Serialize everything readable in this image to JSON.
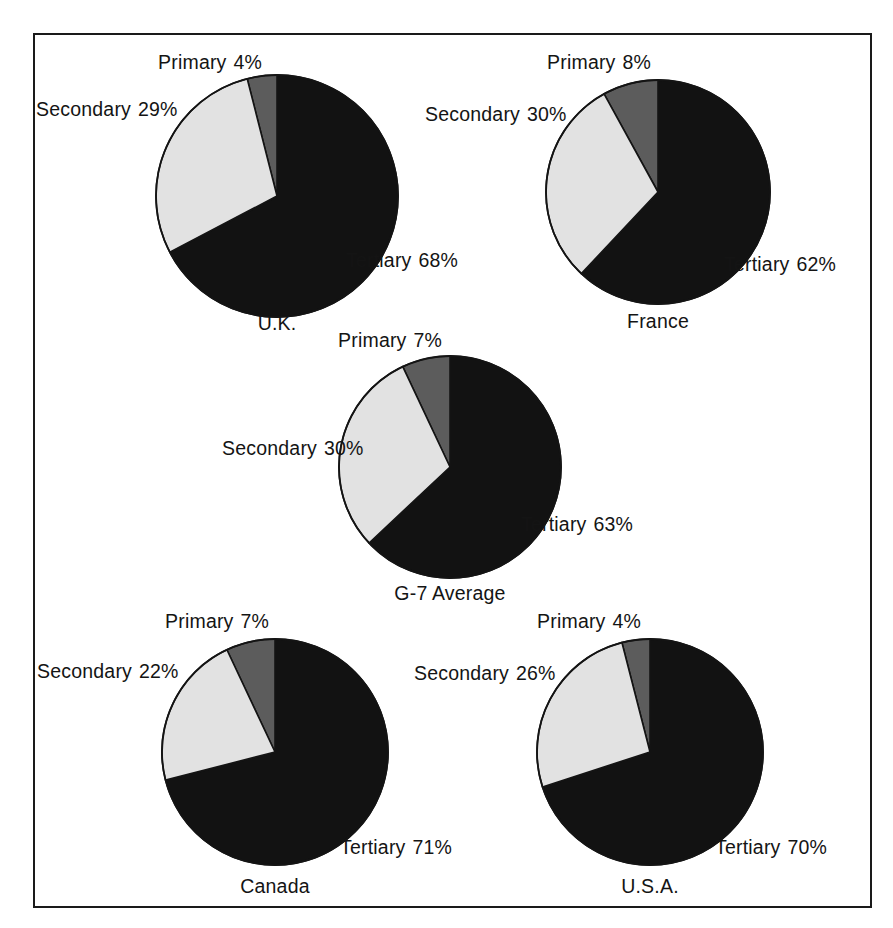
{
  "figure": {
    "border_color": "#1a1a1a",
    "background": "#ffffff"
  },
  "series_colors": {
    "primary": "#5c5c5c",
    "secondary": "#e2e2e2",
    "tertiary": "#121212",
    "outline": "#141414"
  },
  "labels": {
    "primary": "Primary",
    "secondary": "Secondary",
    "tertiary": "Tertiary"
  },
  "charts": [
    {
      "caption": "U.K.",
      "primary_label": "Primary",
      "primary_pct": "4%",
      "secondary_label": "Secondary",
      "secondary_pct": "29%",
      "tertiary_label": "Tertiary",
      "tertiary_pct": "68%"
    },
    {
      "caption": "France",
      "primary_label": "Primary",
      "primary_pct": "8%",
      "secondary_label": "Secondary",
      "secondary_pct": "30%",
      "tertiary_label": "Tertiary",
      "tertiary_pct": "62%"
    },
    {
      "caption": "G-7 Average",
      "primary_label": "Primary",
      "primary_pct": "7%",
      "secondary_label": "Secondary",
      "secondary_pct": "30%",
      "tertiary_label": "Tertiary",
      "tertiary_pct": "63%"
    },
    {
      "caption": "Canada",
      "primary_label": "Primary",
      "primary_pct": "7%",
      "secondary_label": "Secondary",
      "secondary_pct": "22%",
      "tertiary_label": "Tertiary",
      "tertiary_pct": "71%"
    },
    {
      "caption": "U.S.A.",
      "primary_label": "Primary",
      "primary_pct": "4%",
      "secondary_label": "Secondary",
      "secondary_pct": "26%",
      "tertiary_label": "Tertiary",
      "tertiary_pct": "70%"
    }
  ],
  "chart_data": [
    {
      "type": "pie",
      "title": "U.K.",
      "categories": [
        "Primary",
        "Secondary",
        "Tertiary"
      ],
      "values": [
        4,
        29,
        68
      ],
      "unit": "percent",
      "colors": [
        "#5c5c5c",
        "#e2e2e2",
        "#121212"
      ],
      "start_angle_deg": 0,
      "direction": "tertiary-clockwise-from-top",
      "legend": "inline-labels"
    },
    {
      "type": "pie",
      "title": "France",
      "categories": [
        "Primary",
        "Secondary",
        "Tertiary"
      ],
      "values": [
        8,
        30,
        62
      ],
      "unit": "percent",
      "colors": [
        "#5c5c5c",
        "#e2e2e2",
        "#121212"
      ],
      "start_angle_deg": 0,
      "direction": "tertiary-clockwise-from-top",
      "legend": "inline-labels"
    },
    {
      "type": "pie",
      "title": "G-7 Average",
      "categories": [
        "Primary",
        "Secondary",
        "Tertiary"
      ],
      "values": [
        7,
        30,
        63
      ],
      "unit": "percent",
      "colors": [
        "#5c5c5c",
        "#e2e2e2",
        "#121212"
      ],
      "start_angle_deg": 0,
      "direction": "tertiary-clockwise-from-top",
      "legend": "inline-labels"
    },
    {
      "type": "pie",
      "title": "Canada",
      "categories": [
        "Primary",
        "Secondary",
        "Tertiary"
      ],
      "values": [
        7,
        22,
        71
      ],
      "unit": "percent",
      "colors": [
        "#5c5c5c",
        "#e2e2e2",
        "#121212"
      ],
      "start_angle_deg": 0,
      "direction": "tertiary-clockwise-from-top",
      "legend": "inline-labels"
    },
    {
      "type": "pie",
      "title": "U.S.A.",
      "categories": [
        "Primary",
        "Secondary",
        "Tertiary"
      ],
      "values": [
        4,
        26,
        70
      ],
      "unit": "percent",
      "colors": [
        "#5c5c5c",
        "#e2e2e2",
        "#121212"
      ],
      "start_angle_deg": 0,
      "direction": "tertiary-clockwise-from-top",
      "legend": "inline-labels"
    }
  ]
}
